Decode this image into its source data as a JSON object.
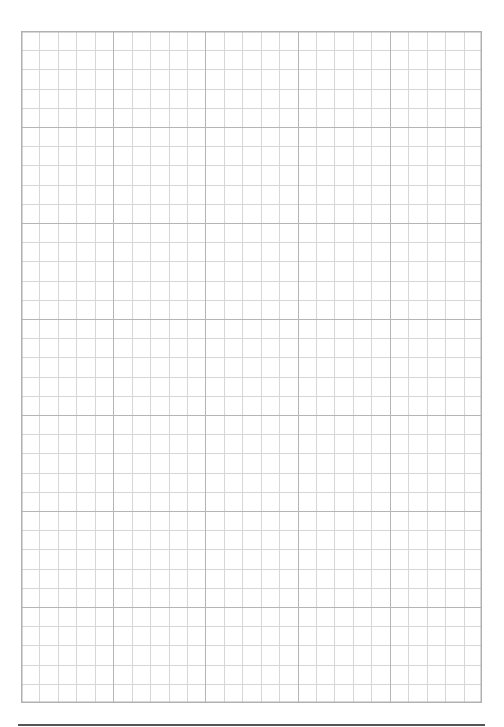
{
  "page": {
    "type": "graph-paper",
    "background": "#ffffff"
  },
  "grid": {
    "left": 21,
    "top": 31,
    "width": 461,
    "height": 672,
    "major_columns": 5,
    "major_rows": 7,
    "minor_per_major": 5,
    "minor_color": "#d6d6d6",
    "major_color": "#b5b5b5",
    "border_color": "#b0b0b0",
    "minor_width": 1,
    "major_width": 1.4
  },
  "bottom_rule": {
    "left": 18,
    "top": 724,
    "width": 467,
    "height": 1.5,
    "color": "#555555"
  }
}
